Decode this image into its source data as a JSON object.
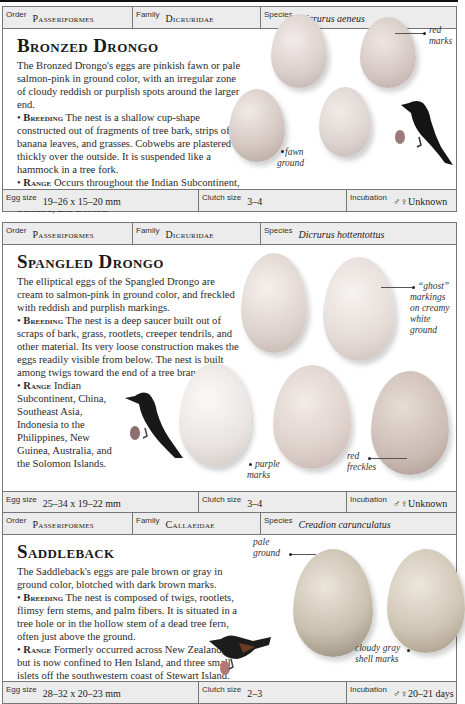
{
  "entries": [
    {
      "order_label": "Order",
      "order": "Passeriformes",
      "family_label": "Family",
      "family": "Dicruridae",
      "species_label": "Species",
      "species": "Dicrurus aeneus",
      "title": "Bronzed Drongo",
      "intro": "The Bronzed Drongo's eggs are pinkish fawn or pale salmon-pink in ground color, with an irregular zone of cloudy reddish or purplish spots around the larger end.",
      "breeding_label": "Breeding",
      "breeding": "The nest is a shallow cup-shape constructed out of fragments of tree bark, strips of banana leaves, and grasses. Cobwebs are plastered thickly over the outside. It is suspended like a hammock in a tree fork.",
      "range_label": "Range",
      "range": "Occurs throughout the Indian Subcontinent, to southern China, Hainan, Taiwan, Southeast Asia, Sumatra, and Borneo.",
      "callouts": [
        "red marks",
        "fawn ground"
      ],
      "egg_size_label": "Egg size",
      "egg_size": "19–26 x 15–20 mm",
      "clutch_label": "Clutch size",
      "clutch": "3–4",
      "incubation_label": "Incubation",
      "incubation": "♂♀Unknown"
    },
    {
      "order_label": "Order",
      "order": "Passeriformes",
      "family_label": "Family",
      "family": "Dicruridae",
      "species_label": "Species",
      "species": "Dicrurus hottentottus",
      "title": "Spangled Drongo",
      "intro": "The elliptical eggs of the Spangled Drongo are cream to salmon-pink in ground color, and freckled with reddish and purplish markings.",
      "breeding_label": "Breeding",
      "breeding": "The nest is a deep saucer built out of scraps of bark, grass, rootlets, creeper tendrils, and other material. Its very loose construction makes the eggs readily visible from below. The nest is built among twigs toward the end of a tree branch.",
      "range_label": "Range",
      "range": "Indian Subcontinent, China, Southeast Asia, Indonesia to the Philippines, New Guinea, Australia, and the Solomon Islands.",
      "callouts": [
        "“ghost” markings on creamy white ground",
        "purple marks",
        "red freckles"
      ],
      "egg_size_label": "Egg size",
      "egg_size": "25–34 x 19–22 mm",
      "clutch_label": "Clutch size",
      "clutch": "3–4",
      "incubation_label": "Incubation",
      "incubation": "♂♀Unknown"
    },
    {
      "order_label": "Order",
      "order": "Passeriformes",
      "family_label": "Family",
      "family": "Callaeidae",
      "species_label": "Species",
      "species": "Creadion carunculatus",
      "title": "Saddleback",
      "intro": "The Saddleback's eggs are pale brown or gray in ground color, blotched with dark brown marks.",
      "breeding_label": "Breeding",
      "breeding": "The nest is composed of twigs, rootlets, flimsy fern stems, and palm fibers. It is situated in a tree hole or in the hollow stem of a dead tree fern, often just above the ground.",
      "range_label": "Range",
      "range": "Formerly occurred across New Zealand, but is now confined to Hen Island, and three small islets off the southwestern coast of Stewart Island.",
      "callouts": [
        "pale ground",
        "cloudy gray shell marks"
      ],
      "egg_size_label": "Egg size",
      "egg_size": "28–32 x 20–23 mm",
      "clutch_label": "Clutch size",
      "clutch": "2–3",
      "incubation_label": "Incubation",
      "incubation": "♂♀20–21 days"
    }
  ],
  "colors": {
    "header_bg": "#ececec",
    "border": "#777777",
    "scale_egg_1": "#9c7a7a",
    "scale_egg_2": "#8c6f6f",
    "scale_egg_3": "#b07878"
  }
}
